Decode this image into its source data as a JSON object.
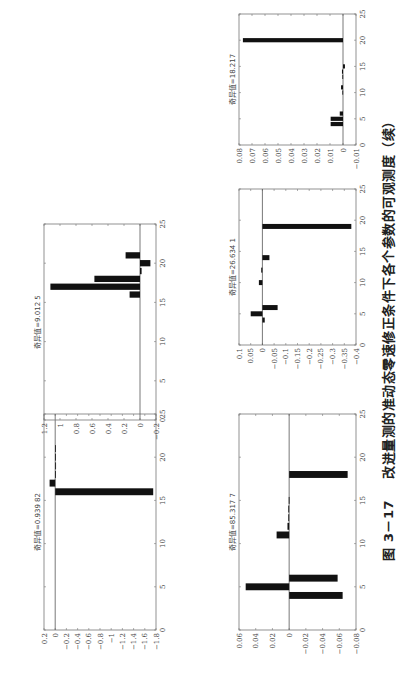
{
  "caption": {
    "number": "图 3－17",
    "text": "改进量测的准动态零速修正条件下各个参数的可观测度（续）"
  },
  "chart_data": [
    {
      "id": "plot-a",
      "type": "bar",
      "title": "奇异值=0.939 82",
      "x": [
        16,
        17,
        18,
        19,
        20,
        21
      ],
      "values": [
        -1.75,
        0.1,
        -0.012,
        -0.015,
        -0.01,
        -0.005
      ],
      "xlim": [
        0,
        25
      ],
      "xticks": [
        0,
        5,
        10,
        15,
        20,
        25
      ],
      "ylim": [
        -1.8,
        0.2
      ],
      "yticks": [
        0.2,
        0,
        -0.2,
        -0.4,
        -0.6,
        -0.8,
        -1,
        -1.2,
        -1.4,
        -1.6,
        -1.8
      ],
      "ytick_labels": [
        "0.2",
        "0",
        "−0.2",
        "−0.4",
        "−0.6",
        "−0.8",
        "−1",
        "−1.2",
        "−1.4",
        "−1.6",
        "−1.8"
      ],
      "xlabel": "",
      "ylabel": "",
      "grid": false
    },
    {
      "id": "plot-b",
      "type": "bar",
      "title": "奇异值=9.012 5",
      "x": [
        16,
        17,
        18,
        19,
        20,
        21
      ],
      "values": [
        0.13,
        1.12,
        0.57,
        -0.02,
        -0.13,
        0.18
      ],
      "xlim": [
        0,
        25
      ],
      "xticks": [
        0,
        5,
        10,
        15,
        20,
        25
      ],
      "ylim": [
        -0.2,
        1.2
      ],
      "yticks": [
        1.2,
        1,
        0.8,
        0.6,
        0.4,
        0.2,
        0,
        -0.2
      ],
      "ytick_labels": [
        "1.2",
        "1",
        "0.8",
        "0.6",
        "0.4",
        "0.2",
        "0",
        "−0.2"
      ],
      "xlabel": "",
      "ylabel": "",
      "grid": false
    },
    {
      "id": "plot-c",
      "type": "bar",
      "title": "奇异值=85.317 7",
      "x": [
        4,
        5,
        6,
        11,
        12,
        13,
        14,
        15,
        18
      ],
      "values": [
        -0.064,
        0.052,
        -0.058,
        0.015,
        0.002,
        0.001,
        0.001,
        0.0005,
        -0.07
      ],
      "xlim": [
        0,
        25
      ],
      "xticks": [
        0,
        5,
        10,
        15,
        20,
        25
      ],
      "ylim": [
        -0.08,
        0.06
      ],
      "yticks": [
        0.06,
        0.04,
        0.02,
        0,
        -0.02,
        -0.04,
        -0.06,
        -0.08
      ],
      "ytick_labels": [
        "0.06",
        "0.04",
        "0.02",
        "0",
        "−0.02",
        "−0.04",
        "−0.06",
        "−0.08"
      ],
      "xlabel": "",
      "ylabel": "",
      "grid": false
    },
    {
      "id": "plot-d",
      "type": "bar",
      "title": "奇异值=26.634 1",
      "x": [
        4,
        5,
        6,
        10,
        12,
        14,
        19
      ],
      "values": [
        -0.01,
        0.05,
        -0.065,
        0.015,
        0.005,
        -0.03,
        -0.38
      ],
      "xlim": [
        0,
        25
      ],
      "xticks": [
        0,
        5,
        10,
        15,
        20,
        25
      ],
      "ylim": [
        -0.4,
        0.1
      ],
      "yticks": [
        0.1,
        0.05,
        0,
        -0.05,
        -0.1,
        -0.15,
        -0.2,
        -0.25,
        -0.3,
        -0.35,
        -0.4
      ],
      "ytick_labels": [
        "0.1",
        "0.05",
        "0",
        "−0.05",
        "−0.1",
        "−0.15",
        "−0.2",
        "−0.25",
        "−0.3",
        "−0.35",
        "−0.4"
      ],
      "xlabel": "",
      "ylabel": "",
      "grid": false
    },
    {
      "id": "plot-e",
      "type": "bar",
      "title": "奇异值=18.217",
      "x": [
        4,
        5,
        6,
        10,
        11,
        13,
        14,
        15,
        20
      ],
      "values": [
        0.0095,
        0.0095,
        0.0025,
        0.0005,
        0.0015,
        0.0005,
        0.0008,
        -0.0015,
        0.077
      ],
      "xlim": [
        0,
        25
      ],
      "xticks": [
        0,
        5,
        10,
        15,
        20,
        25
      ],
      "ylim": [
        -0.01,
        0.08
      ],
      "yticks": [
        0.08,
        0.07,
        0.06,
        0.05,
        0.04,
        0.03,
        0.02,
        0.01,
        0,
        -0.01
      ],
      "ytick_labels": [
        "0.08",
        "0.07",
        "0.06",
        "0.05",
        "0.04",
        "0.03",
        "0.02",
        "0.01",
        "0",
        "−0.01"
      ],
      "xlabel": "",
      "ylabel": "",
      "grid": false
    }
  ],
  "layout": {
    "bar_color": "#111111",
    "axis_color": "#777777",
    "zero_line_color": "#555555",
    "panels": {
      "plot-a": {
        "left": 15,
        "top": 30,
        "width": 250,
        "height": 140
      },
      "plot-b": {
        "left": 225,
        "top": 30,
        "width": 230,
        "height": 140
      },
      "plot-c": {
        "left": 15,
        "top": 225,
        "width": 250,
        "height": 145
      },
      "plot-d": {
        "left": 300,
        "top": 225,
        "width": 190,
        "height": 145
      },
      "plot-e": {
        "left": 500,
        "top": 225,
        "width": 165,
        "height": 145
      }
    }
  }
}
